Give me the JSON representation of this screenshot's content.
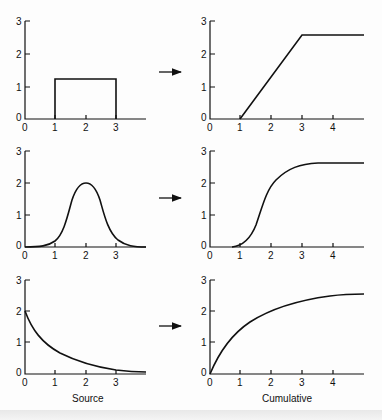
{
  "captions": {
    "left": "Source",
    "right": "Cumulative"
  },
  "arrow_icon": "right-arrow",
  "panels": [
    {
      "row": 1,
      "source": {
        "y_ticks": [
          "0",
          "1",
          "2",
          "3"
        ],
        "x_ticks": [
          "0",
          "1",
          "2",
          "3"
        ],
        "shape": "rectangle pulse, height ~1.3 from x=1 to x=3"
      },
      "cumulative": {
        "y_ticks": [
          "0",
          "1",
          "2",
          "3"
        ],
        "x_ticks": [
          "0",
          "1",
          "2",
          "3",
          "4"
        ],
        "shape": "linear ramp from (1,0) to (3,2.6) then flat"
      }
    },
    {
      "row": 2,
      "source": {
        "y_ticks": [
          "0",
          "1",
          "2",
          "3"
        ],
        "x_ticks": [
          "0",
          "1",
          "2",
          "3"
        ],
        "shape": "bell curve peak 2 at x=2"
      },
      "cumulative": {
        "y_ticks": [
          "0",
          "1",
          "2",
          "3"
        ],
        "x_ticks": [
          "0",
          "1",
          "2",
          "3",
          "4"
        ],
        "shape": "sigmoid rising to ~2.6"
      }
    },
    {
      "row": 3,
      "source": {
        "y_ticks": [
          "0",
          "1",
          "2",
          "3"
        ],
        "x_ticks": [
          "0",
          "1",
          "2",
          "3"
        ],
        "shape": "exponential decay from 2"
      },
      "cumulative": {
        "y_ticks": [
          "0",
          "1",
          "2",
          "3"
        ],
        "x_ticks": [
          "0",
          "1",
          "2",
          "3",
          "4"
        ],
        "shape": "saturating growth toward ~2.6"
      }
    }
  ],
  "tick_labels": {
    "y": [
      "0",
      "1",
      "2",
      "3"
    ],
    "x_source": [
      "0",
      "1",
      "2",
      "3"
    ],
    "x_cumulative": [
      "0",
      "1",
      "2",
      "3",
      "4"
    ]
  }
}
